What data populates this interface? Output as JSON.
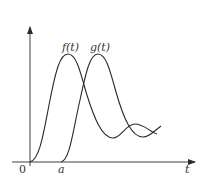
{
  "diagram": {
    "type": "function-plot",
    "curves": [
      {
        "id": "f",
        "label": "f(t)",
        "color": "#2a2a2a"
      },
      {
        "id": "g",
        "label": "g(t)",
        "color": "#2a2a2a"
      }
    ],
    "axes": {
      "origin_label": "0",
      "x_axis_label": "t",
      "x_tick_label": "a"
    },
    "colors": {
      "background": "#ffffff",
      "stroke": "#2a2a2a",
      "text": "#333333"
    }
  }
}
